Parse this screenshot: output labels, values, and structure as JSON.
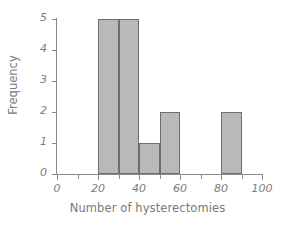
{
  "chart_data": {
    "type": "bar",
    "title": "",
    "xlabel": "Number of hysterectomies",
    "ylabel": "Frequency",
    "xlim": [
      0,
      100
    ],
    "ylim": [
      0,
      5
    ],
    "grid": false,
    "legend": null,
    "bin_width": 10,
    "bin_edges": [
      20,
      30,
      40,
      50,
      60,
      80,
      90
    ],
    "categories": [
      "20-30",
      "30-40",
      "40-50",
      "50-60",
      "80-90"
    ],
    "values": [
      5,
      5,
      1,
      2,
      2
    ],
    "bars": [
      {
        "label": "20-30",
        "start": 20,
        "end": 30,
        "value": 5
      },
      {
        "label": "30-40",
        "start": 30,
        "end": 40,
        "value": 5
      },
      {
        "label": "40-50",
        "start": 40,
        "end": 50,
        "value": 1
      },
      {
        "label": "50-60",
        "start": 50,
        "end": 60,
        "value": 2
      },
      {
        "label": "80-90",
        "start": 80,
        "end": 90,
        "value": 2
      }
    ],
    "x_ticks_major": [
      0,
      20,
      40,
      60,
      80,
      100
    ],
    "x_ticks_minor": [
      10,
      30,
      50,
      70,
      90
    ],
    "x_tick_labels": [
      "0",
      "20",
      "40",
      "60",
      "80",
      "100"
    ],
    "y_ticks": [
      0,
      1,
      2,
      3,
      4,
      5
    ],
    "y_tick_labels": [
      "0",
      "1",
      "2",
      "3",
      "4",
      "5"
    ],
    "colors": {
      "bar_fill": "#b9b9b9",
      "bar_edge": "#6e6e6e",
      "axis": "#8a8a8a",
      "text": "#7a7a7a",
      "background": "#ffffff"
    }
  }
}
